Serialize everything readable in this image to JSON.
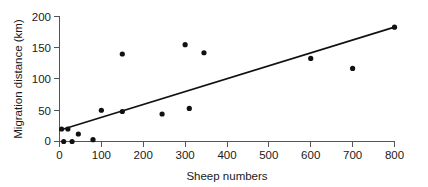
{
  "chart_data": {
    "type": "scatter",
    "title": "",
    "xlabel": "Sheep numbers",
    "ylabel": "Migration distance (km)",
    "xlim": [
      0,
      800
    ],
    "ylim": [
      0,
      200
    ],
    "xticks": [
      0,
      100,
      200,
      300,
      400,
      500,
      600,
      700,
      800
    ],
    "xtick_labels": [
      "0",
      "100",
      "200",
      "300",
      "400",
      "500",
      "600",
      "700",
      "800"
    ],
    "yticks": [
      0,
      50,
      100,
      150,
      200
    ],
    "ytick_labels": [
      "0",
      "50",
      "100",
      "150",
      "200"
    ],
    "grid": false,
    "legend": false,
    "point_color": "#111111",
    "line_color": "#111111",
    "axis_color": "#555555",
    "series": [
      {
        "name": "Observations",
        "x": [
          5,
          10,
          20,
          30,
          45,
          80,
          100,
          150,
          150,
          245,
          300,
          310,
          345,
          600,
          700,
          800
        ],
        "y": [
          20,
          0,
          20,
          0,
          12,
          3,
          50,
          48,
          140,
          44,
          155,
          53,
          142,
          133,
          117,
          183
        ]
      }
    ],
    "trend_line": {
      "name": "Linear fit",
      "x": [
        0,
        800
      ],
      "y": [
        18,
        183
      ]
    }
  }
}
